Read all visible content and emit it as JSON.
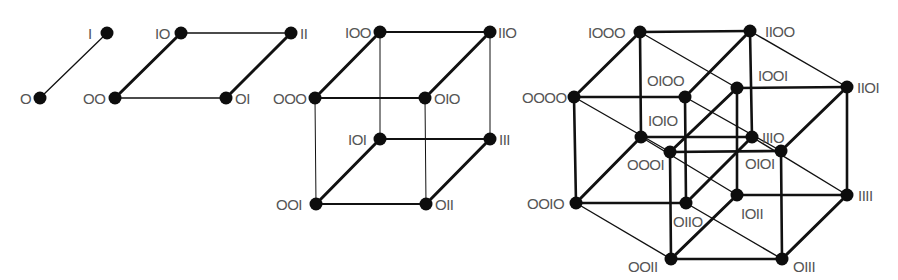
{
  "diagram": {
    "colors": {
      "node": "#0d0d0d",
      "edge": "#111111",
      "label": "#555555",
      "background": "#ffffff"
    },
    "figures": [
      {
        "id": "dim1",
        "dimension": 1,
        "nodes": [
          {
            "label": "0",
            "x": 40,
            "y": 98,
            "lx": 20,
            "ly": 104,
            "anchor": "start"
          },
          {
            "label": "1",
            "x": 107,
            "y": 33,
            "lx": 88,
            "ly": 39,
            "anchor": "start"
          }
        ],
        "edges": [
          {
            "from": "0",
            "to": "1",
            "w": 1.3
          }
        ]
      },
      {
        "id": "dim2",
        "dimension": 2,
        "nodes": [
          {
            "label": "00",
            "x": 115,
            "y": 98,
            "lx": 83,
            "ly": 104,
            "anchor": "start"
          },
          {
            "label": "01",
            "x": 226,
            "y": 98,
            "lx": 235,
            "ly": 104,
            "anchor": "start"
          },
          {
            "label": "10",
            "x": 181,
            "y": 33,
            "lx": 155,
            "ly": 39,
            "anchor": "start"
          },
          {
            "label": "11",
            "x": 291,
            "y": 33,
            "lx": 300,
            "ly": 39,
            "anchor": "start"
          }
        ],
        "edges": [
          {
            "from": "00",
            "to": "10",
            "w": 3
          },
          {
            "from": "01",
            "to": "11",
            "w": 3
          },
          {
            "from": "00",
            "to": "01",
            "w": 1.3
          },
          {
            "from": "10",
            "to": "11",
            "w": 1.3
          }
        ]
      },
      {
        "id": "dim3",
        "dimension": 3,
        "nodes": [
          {
            "label": "000",
            "x": 315,
            "y": 98,
            "lx": 273,
            "ly": 104,
            "anchor": "start"
          },
          {
            "label": "010",
            "x": 425,
            "y": 98,
            "lx": 434,
            "ly": 104,
            "anchor": "start"
          },
          {
            "label": "100",
            "x": 380,
            "y": 32,
            "lx": 345,
            "ly": 38,
            "anchor": "start"
          },
          {
            "label": "110",
            "x": 490,
            "y": 32,
            "lx": 498,
            "ly": 38,
            "anchor": "start"
          },
          {
            "label": "001",
            "x": 316,
            "y": 204,
            "lx": 276,
            "ly": 210,
            "anchor": "start"
          },
          {
            "label": "011",
            "x": 426,
            "y": 204,
            "lx": 435,
            "ly": 210,
            "anchor": "start"
          },
          {
            "label": "101",
            "x": 380,
            "y": 139,
            "lx": 348,
            "ly": 145,
            "anchor": "start"
          },
          {
            "label": "111",
            "x": 490,
            "y": 139,
            "lx": 499,
            "ly": 145,
            "anchor": "start"
          }
        ],
        "edges": [
          {
            "from": "000",
            "to": "100",
            "w": 3
          },
          {
            "from": "010",
            "to": "110",
            "w": 3
          },
          {
            "from": "001",
            "to": "101",
            "w": 3
          },
          {
            "from": "011",
            "to": "111",
            "w": 3
          },
          {
            "from": "000",
            "to": "010",
            "w": 2.2
          },
          {
            "from": "100",
            "to": "110",
            "w": 2.2
          },
          {
            "from": "001",
            "to": "011",
            "w": 2.2
          },
          {
            "from": "101",
            "to": "111",
            "w": 2.2
          },
          {
            "from": "000",
            "to": "001",
            "w": 1
          },
          {
            "from": "010",
            "to": "011",
            "w": 1
          },
          {
            "from": "100",
            "to": "101",
            "w": 1
          },
          {
            "from": "110",
            "to": "111",
            "w": 1
          }
        ]
      },
      {
        "id": "dim4",
        "dimension": 4,
        "nodes": [
          {
            "label": "0000",
            "x": 574,
            "y": 97,
            "lx": 522,
            "ly": 103,
            "anchor": "start"
          },
          {
            "label": "0100",
            "x": 685,
            "y": 97,
            "lx": 647,
            "ly": 86,
            "anchor": "start"
          },
          {
            "label": "1000",
            "x": 640,
            "y": 32,
            "lx": 588,
            "ly": 38,
            "anchor": "start"
          },
          {
            "label": "1100",
            "x": 750,
            "y": 31,
            "lx": 765,
            "ly": 37,
            "anchor": "start"
          },
          {
            "label": "0010",
            "x": 576,
            "y": 203,
            "lx": 527,
            "ly": 209,
            "anchor": "start"
          },
          {
            "label": "0110",
            "x": 686,
            "y": 203,
            "lx": 673,
            "ly": 227,
            "anchor": "start"
          },
          {
            "label": "1010",
            "x": 641,
            "y": 137,
            "lx": 648,
            "ly": 126,
            "anchor": "start"
          },
          {
            "label": "1110",
            "x": 752,
            "y": 137,
            "lx": 762,
            "ly": 143,
            "anchor": "start"
          },
          {
            "label": "0001",
            "x": 670,
            "y": 152,
            "lx": 627,
            "ly": 170,
            "anchor": "start"
          },
          {
            "label": "0101",
            "x": 781,
            "y": 151,
            "lx": 745,
            "ly": 169,
            "anchor": "start"
          },
          {
            "label": "1001",
            "x": 737,
            "y": 88,
            "lx": 758,
            "ly": 81,
            "anchor": "start"
          },
          {
            "label": "1101",
            "x": 847,
            "y": 87,
            "lx": 857,
            "ly": 93,
            "anchor": "start"
          },
          {
            "label": "0011",
            "x": 671,
            "y": 259,
            "lx": 628,
            "ly": 272,
            "anchor": "start"
          },
          {
            "label": "0111",
            "x": 782,
            "y": 259,
            "lx": 793,
            "ly": 272,
            "anchor": "start"
          },
          {
            "label": "1011",
            "x": 737,
            "y": 195,
            "lx": 741,
            "ly": 219,
            "anchor": "start"
          },
          {
            "label": "1111",
            "x": 847,
            "y": 195,
            "lx": 858,
            "ly": 201,
            "anchor": "start"
          }
        ],
        "edges": [
          {
            "from": "0000",
            "to": "1000",
            "w": 3
          },
          {
            "from": "0100",
            "to": "1100",
            "w": 3
          },
          {
            "from": "0010",
            "to": "1010",
            "w": 3
          },
          {
            "from": "0110",
            "to": "1110",
            "w": 3
          },
          {
            "from": "0001",
            "to": "1001",
            "w": 3
          },
          {
            "from": "0101",
            "to": "1101",
            "w": 3
          },
          {
            "from": "0011",
            "to": "1011",
            "w": 3
          },
          {
            "from": "0111",
            "to": "1111",
            "w": 3
          },
          {
            "from": "0000",
            "to": "0100",
            "w": 2.6
          },
          {
            "from": "1000",
            "to": "1100",
            "w": 2.6
          },
          {
            "from": "0010",
            "to": "0110",
            "w": 2.6
          },
          {
            "from": "1010",
            "to": "1110",
            "w": 2.6
          },
          {
            "from": "0001",
            "to": "0101",
            "w": 2.6
          },
          {
            "from": "1001",
            "to": "1101",
            "w": 2.6
          },
          {
            "from": "0011",
            "to": "0111",
            "w": 2.6
          },
          {
            "from": "1011",
            "to": "1111",
            "w": 2.6
          },
          {
            "from": "0000",
            "to": "0010",
            "w": 2.6
          },
          {
            "from": "0100",
            "to": "0110",
            "w": 2.6
          },
          {
            "from": "1000",
            "to": "1010",
            "w": 2.6
          },
          {
            "from": "1100",
            "to": "1110",
            "w": 2.6
          },
          {
            "from": "0001",
            "to": "0011",
            "w": 2.6
          },
          {
            "from": "0101",
            "to": "0111",
            "w": 2.6
          },
          {
            "from": "1001",
            "to": "1011",
            "w": 2.6
          },
          {
            "from": "1101",
            "to": "1111",
            "w": 2.6
          },
          {
            "from": "0000",
            "to": "0001",
            "w": 1.4
          },
          {
            "from": "0100",
            "to": "0101",
            "w": 1.4
          },
          {
            "from": "1000",
            "to": "1001",
            "w": 1.4
          },
          {
            "from": "1100",
            "to": "1101",
            "w": 1.4
          },
          {
            "from": "0010",
            "to": "0011",
            "w": 1.4
          },
          {
            "from": "0110",
            "to": "0111",
            "w": 1.4
          },
          {
            "from": "1010",
            "to": "1011",
            "w": 1.4
          },
          {
            "from": "1110",
            "to": "1111",
            "w": 1.4
          }
        ]
      }
    ]
  }
}
